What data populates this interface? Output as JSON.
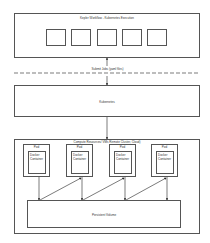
{
  "workflow": {
    "title": "Kepler Workflow - Kubernetes Execution",
    "steps": 5
  },
  "submit_label": "Submit Jobs (yaml files)",
  "kubernetes": {
    "label": "Kubernetes"
  },
  "compute": {
    "title": "Compute Resources/ VMs Remote Cluster, Cloud)",
    "pods": [
      {
        "label": "Pod",
        "container": "Docker Container"
      },
      {
        "label": "Pod",
        "container": "Docker Container"
      },
      {
        "label": "Pod",
        "container": "Docker Container"
      },
      {
        "label": "Pod",
        "container": "Docker Container"
      }
    ],
    "volume": "Persistent Volume"
  }
}
